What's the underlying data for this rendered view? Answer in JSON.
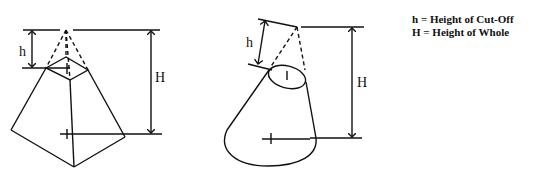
{
  "figures": [
    {
      "name": "truncated-pyramid",
      "labels": {
        "small": "h",
        "large": "H"
      }
    },
    {
      "name": "truncated-cone",
      "labels": {
        "small": "h",
        "large": "H"
      }
    }
  ],
  "legend": [
    {
      "symbol": "h",
      "eq": "=",
      "text": "Height of Cut-Off"
    },
    {
      "symbol": "H",
      "eq": "=",
      "text": "Height of Whole"
    }
  ],
  "colors": {
    "ink": "#111111",
    "background": "#ffffff"
  }
}
